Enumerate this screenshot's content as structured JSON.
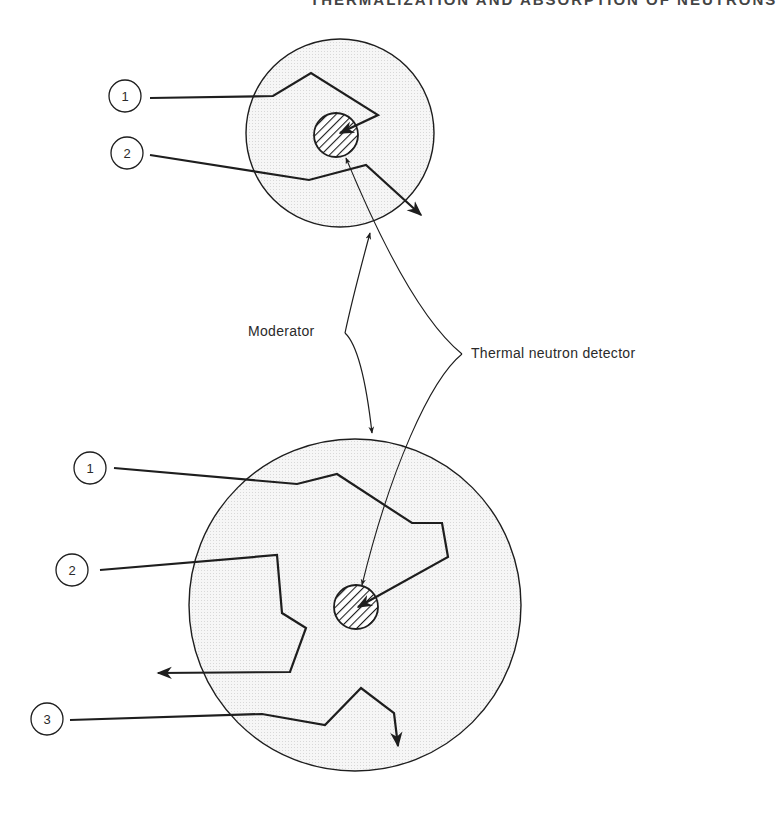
{
  "header": {
    "fragment": "THERMALIZATION AND ABSORPTION OF NEUTRONS"
  },
  "labels": {
    "moderator": "Moderator",
    "detector": "Thermal neutron detector"
  },
  "small_sphere": {
    "paths": [
      {
        "number": "1"
      },
      {
        "number": "2"
      }
    ]
  },
  "large_sphere": {
    "paths": [
      {
        "number": "1"
      },
      {
        "number": "2"
      },
      {
        "number": "3"
      }
    ]
  },
  "colors": {
    "line": "#1e1e1e",
    "moderator_fill": "#f1f1f1",
    "text": "#2a2a2a"
  }
}
